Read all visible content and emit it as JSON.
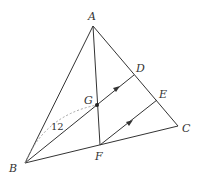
{
  "diagram": {
    "type": "geometry-triangle",
    "points": {
      "A": {
        "label": "A",
        "x": 93,
        "y": 26
      },
      "B": {
        "label": "B",
        "x": 25,
        "y": 163
      },
      "C": {
        "label": "C",
        "x": 178,
        "y": 126
      },
      "D": {
        "label": "D",
        "x": 134,
        "y": 75
      },
      "E": {
        "label": "E",
        "x": 157,
        "y": 100
      },
      "F": {
        "label": "F",
        "x": 100,
        "y": 145
      },
      "G": {
        "label": "G",
        "x": 97,
        "y": 105
      }
    },
    "segments": [
      "AB",
      "AC",
      "BC",
      "AF",
      "BD",
      "FE"
    ],
    "parallel_marks": [
      "GD",
      "FE"
    ],
    "dashed_arc": {
      "from": "B",
      "to": "G",
      "label": "12"
    },
    "colors": {
      "line": "#333333",
      "dashed": "#999999"
    }
  }
}
